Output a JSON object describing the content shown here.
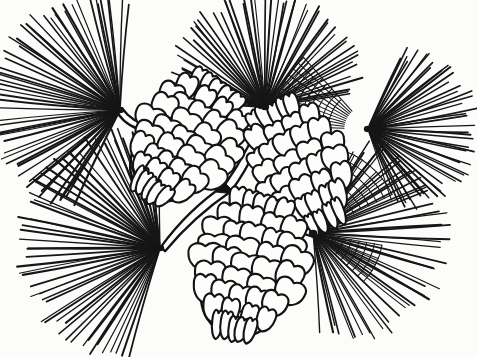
{
  "artwork": {
    "title": "Pine Cones and Needles",
    "subject": "pine-cone-cluster-line-drawing",
    "medium": "ink-line-engraving",
    "style": "black-and-white-botanical-illustration",
    "width": 477,
    "height": 357,
    "background_color": "#fcfcfb",
    "ink_color": "#141414",
    "scale_fill_color": "#fdfdfc"
  },
  "composition": {
    "description": "Four radiating pine-needle fascicles surround three overlapping pine cones joined by a forked woody twig.",
    "cone_count": 3,
    "fascicle_count": 4,
    "branch_count": 1,
    "crosshatch_patch_count": 3
  },
  "fascicles": [
    {
      "name": "upper-left-needle-spray",
      "node_x": 120,
      "node_y": 110,
      "needle_count": 56,
      "start_angle_deg": 118,
      "end_angle_deg": 272,
      "min_length": 86,
      "max_length": 128,
      "stroke_width": 1.55
    },
    {
      "name": "upper-center-needle-spray",
      "node_x": 265,
      "node_y": 107,
      "needle_count": 54,
      "start_angle_deg": 183,
      "end_angle_deg": 352,
      "min_length": 74,
      "max_length": 112,
      "stroke_width": 1.5
    },
    {
      "name": "right-needle-spray",
      "node_x": 368,
      "node_y": 129,
      "needle_count": 48,
      "start_angle_deg": -68,
      "end_angle_deg": 72,
      "min_length": 62,
      "max_length": 106,
      "stroke_width": 1.5
    },
    {
      "name": "lower-left-needle-spray",
      "node_x": 160,
      "node_y": 248,
      "needle_count": 58,
      "start_angle_deg": 108,
      "end_angle_deg": 268,
      "min_length": 84,
      "max_length": 140,
      "stroke_width": 1.6
    },
    {
      "name": "lower-right-needle-spray",
      "node_x": 313,
      "node_y": 233,
      "needle_count": 46,
      "start_angle_deg": -64,
      "end_angle_deg": 84,
      "min_length": 70,
      "max_length": 132,
      "stroke_width": 1.55
    }
  ],
  "crosshatch_patches": [
    {
      "name": "upper-right-crosshatch",
      "origin_x": 368,
      "origin_y": 129,
      "start_angle_deg": 182,
      "end_angle_deg": 228,
      "radial_count": 11,
      "arc_count": 9,
      "inner_radius": 24,
      "outer_radius": 96
    },
    {
      "name": "right-lower-crosshatch",
      "origin_x": 313,
      "origin_y": 233,
      "start_angle_deg": -74,
      "end_angle_deg": -26,
      "radial_count": 9,
      "arc_count": 7,
      "inner_radius": 22,
      "outer_radius": 88
    },
    {
      "name": "mid-right-crosshatch",
      "origin_x": 313,
      "origin_y": 233,
      "start_angle_deg": 10,
      "end_angle_deg": 44,
      "radial_count": 7,
      "arc_count": 6,
      "inner_radius": 20,
      "outer_radius": 70
    }
  ],
  "cones": [
    {
      "name": "upper-left-cone",
      "label": "Upper left pine cone",
      "center_x": 183,
      "center_y": 140,
      "length": 132,
      "width": 76,
      "rotation_deg": 34,
      "scale_rows": 9,
      "scales_per_row": 4
    },
    {
      "name": "middle-right-cone",
      "label": "Middle right pine cone",
      "center_x": 300,
      "center_y": 168,
      "length": 128,
      "width": 70,
      "rotation_deg": -25,
      "scale_rows": 8,
      "scales_per_row": 4
    },
    {
      "name": "lower-center-cone",
      "label": "Lower center pine cone",
      "center_x": 247,
      "center_y": 268,
      "length": 138,
      "width": 82,
      "rotation_deg": 13,
      "scale_rows": 9,
      "scales_per_row": 4
    }
  ],
  "branch": {
    "name": "forked-twig",
    "fork_x": 228,
    "fork_y": 188,
    "upper_tip_x": 268,
    "upper_tip_y": 108,
    "left_tip_x": 163,
    "left_tip_y": 249,
    "right_tip_x": 314,
    "right_tip_y": 234,
    "thickness": 8,
    "wedge_label": "dark-triangular-notch"
  },
  "stems": [
    {
      "name": "upper-left-cone-stem",
      "x1": 120,
      "y1": 111,
      "x2": 148,
      "y2": 128,
      "thickness": 7
    }
  ]
}
